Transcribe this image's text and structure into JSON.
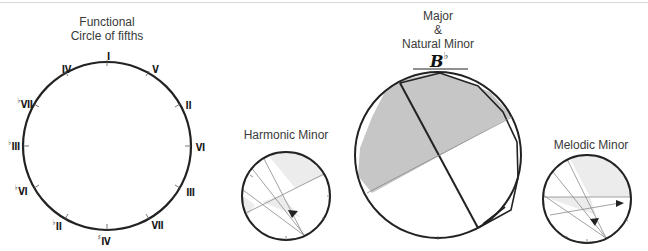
{
  "diagrams": {
    "functional": {
      "title_line1": "Functional",
      "title_line2": "Circle of fifths",
      "degrees": [
        {
          "label": "I",
          "accidental": ""
        },
        {
          "label": "V",
          "accidental": ""
        },
        {
          "label": "II",
          "accidental": ""
        },
        {
          "label": "VI",
          "accidental": ""
        },
        {
          "label": "III",
          "accidental": ""
        },
        {
          "label": "VII",
          "accidental": ""
        },
        {
          "label": "IV",
          "accidental": "♯"
        },
        {
          "label": "II",
          "accidental": "♭"
        },
        {
          "label": "VI",
          "accidental": "♭"
        },
        {
          "label": "III",
          "accidental": "♭"
        },
        {
          "label": "VII",
          "accidental": "♭"
        },
        {
          "label": "IV",
          "accidental": ""
        }
      ]
    },
    "harmonic_minor": {
      "title": "Harmonic Minor"
    },
    "major_natural_minor": {
      "title_line1": "Major",
      "title_line2": "&",
      "title_line3": "Natural Minor",
      "key_label": "B",
      "key_accidental": "♭"
    },
    "melodic_minor": {
      "title": "Melodic Minor"
    }
  },
  "colors": {
    "stroke": "#222222",
    "thin_line": "#8a8a8a",
    "shade_dark": "#c8c8c8",
    "shade_light": "#ececec"
  }
}
